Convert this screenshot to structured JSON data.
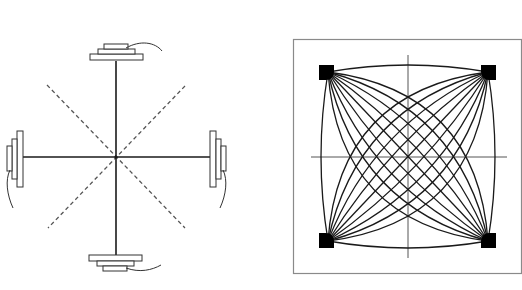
{
  "figure": {
    "left_panel": {
      "description": "Four-speaker/transducer cross arrangement with dashed diagonals",
      "center": [
        116,
        157
      ],
      "axis_color": "#1a1a1a",
      "dashed_color": "#555555",
      "units": [
        {
          "position": "top",
          "cable_direction": "right"
        },
        {
          "position": "bottom",
          "cable_direction": "right"
        },
        {
          "position": "left",
          "cable_direction": "down"
        },
        {
          "position": "right",
          "cable_direction": "down"
        }
      ]
    },
    "right_panel": {
      "description": "Interference pattern of curved lines radiating from four corner sources",
      "frame_color": "#8a8a8a",
      "line_color": "#1a1a1a",
      "sources": [
        "top-left",
        "top-right",
        "bottom-left",
        "bottom-right"
      ],
      "lines_per_fan": 9
    },
    "captions": [
      "",
      ""
    ]
  }
}
